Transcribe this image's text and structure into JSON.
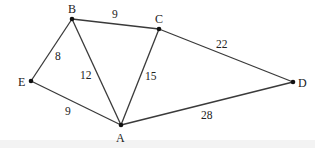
{
  "graph": {
    "nodes": [
      {
        "id": "B",
        "label": "B",
        "x": 72,
        "y": 19,
        "lx": 68,
        "ly": 13
      },
      {
        "id": "C",
        "label": "C",
        "x": 159,
        "y": 29,
        "lx": 155,
        "ly": 23
      },
      {
        "id": "E",
        "label": "E",
        "x": 31,
        "y": 81,
        "lx": 18,
        "ly": 86
      },
      {
        "id": "A",
        "label": "A",
        "x": 121,
        "y": 125,
        "lx": 116,
        "ly": 142
      },
      {
        "id": "D",
        "label": "D",
        "x": 293,
        "y": 82,
        "lx": 298,
        "ly": 87
      }
    ],
    "edges": [
      {
        "from": "B",
        "to": "C",
        "weight": "9",
        "wx": 112,
        "wy": 18
      },
      {
        "from": "B",
        "to": "E",
        "weight": "8",
        "wx": 55,
        "wy": 60
      },
      {
        "from": "B",
        "to": "A",
        "weight": "12",
        "wx": 80,
        "wy": 79
      },
      {
        "from": "C",
        "to": "A",
        "weight": "15",
        "wx": 145,
        "wy": 80
      },
      {
        "from": "C",
        "to": "D",
        "weight": "22",
        "wx": 216,
        "wy": 48
      },
      {
        "from": "E",
        "to": "A",
        "weight": "9",
        "wx": 65,
        "wy": 115
      },
      {
        "from": "A",
        "to": "D",
        "weight": "28",
        "wx": 201,
        "wy": 119
      }
    ]
  }
}
